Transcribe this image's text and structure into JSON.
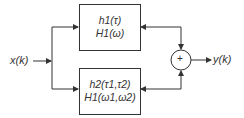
{
  "diagram": {
    "input_label": "x(k)",
    "output_label": "y(k)",
    "sum_symbol": "+",
    "blocks": [
      {
        "line1": "h1(τ)",
        "line2": "H1(ω)"
      },
      {
        "line1": "h2(τ1,τ2)",
        "line2": "H1(ω1,ω2)"
      }
    ],
    "colors": {
      "stroke": "#333333",
      "background": "#ffffff"
    }
  }
}
